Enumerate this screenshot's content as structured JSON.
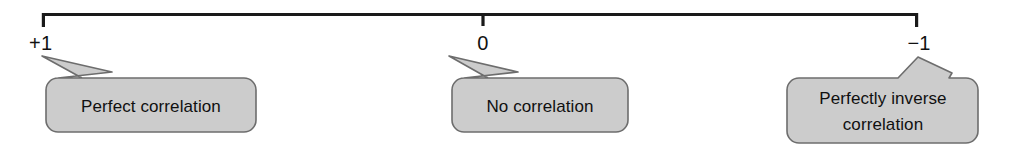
{
  "figure": {
    "name": "correlation-coefficient-scale",
    "background_color": "#ffffff",
    "line_color": "#1a1a1a",
    "callout_fill": "#cccccc",
    "callout_border": "#6d6d6d",
    "text_color": "#101010"
  },
  "scale": {
    "axis_label": "",
    "ticks": [
      {
        "id": "tick-plus-one",
        "label": "+1",
        "x": 42
      },
      {
        "id": "tick-zero",
        "label": "0",
        "x": 483
      },
      {
        "id": "tick-minus-one",
        "label": "−1",
        "x": 918
      }
    ]
  },
  "callouts": [
    {
      "id": "callout-perfect-correlation",
      "lines": [
        "Perfect correlation"
      ],
      "line1": "Perfect correlation",
      "line2": "",
      "points_to": "+1",
      "tail_direction": "up-left"
    },
    {
      "id": "callout-no-correlation",
      "lines": [
        "No correlation"
      ],
      "line1": "No correlation",
      "line2": "",
      "points_to": "0",
      "tail_direction": "up-left"
    },
    {
      "id": "callout-perfectly-inverse-correlation",
      "lines": [
        "Perfectly inverse",
        "correlation"
      ],
      "line1": "Perfectly inverse",
      "line2": "correlation",
      "points_to": "−1",
      "tail_direction": "up-right"
    }
  ]
}
